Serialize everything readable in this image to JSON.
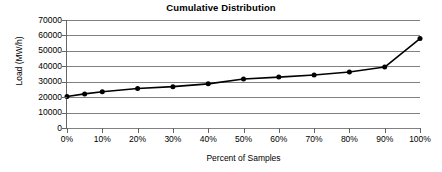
{
  "chart_data": {
    "type": "line",
    "title": "Cumulative Distribution",
    "xlabel": "Percent of Samples",
    "ylabel": "Load (MW/h)",
    "grid": true,
    "legend": "none",
    "xlim": [
      0,
      100
    ],
    "ylim": [
      0,
      70000
    ],
    "x_tick_labels": [
      "0%",
      "10%",
      "20%",
      "30%",
      "40%",
      "50%",
      "60%",
      "70%",
      "80%",
      "90%",
      "100%"
    ],
    "x_ticks": [
      0,
      10,
      20,
      30,
      40,
      50,
      60,
      70,
      80,
      90,
      100
    ],
    "y_tick_labels": [
      "0",
      "10000",
      "20000",
      "30000",
      "40000",
      "50000",
      "60000",
      "70000"
    ],
    "y_ticks": [
      0,
      10000,
      20000,
      30000,
      40000,
      50000,
      60000,
      70000
    ],
    "series": [
      {
        "name": "Cumulative Load",
        "marker": "filled-circle",
        "color": "#000000",
        "x": [
          0,
          5,
          10,
          20,
          30,
          40,
          50,
          60,
          70,
          80,
          90,
          100
        ],
        "values": [
          20400,
          22100,
          23500,
          25600,
          26800,
          28600,
          31800,
          33000,
          34400,
          36300,
          39500,
          58000
        ]
      }
    ]
  },
  "colors": {
    "line": "#000000",
    "marker": "#000000",
    "grid": "#808080",
    "axis": "#666666",
    "background": "#ffffff",
    "text": "#000000"
  }
}
